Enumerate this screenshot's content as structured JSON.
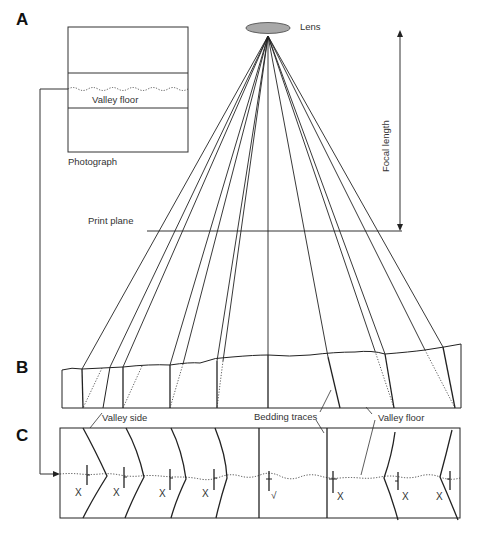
{
  "panels": {
    "a": "A",
    "b": "B",
    "c": "C"
  },
  "labels": {
    "lens": "Lens",
    "focal_length": "Focal length",
    "print_plane": "Print plane",
    "photograph": "Photograph",
    "photo_valley_floor": "Valley floor",
    "valley_side": "Valley side",
    "bedding_traces": "Bedding traces",
    "valley_floor": "Valley floor"
  },
  "marks": [
    "X",
    "X",
    "X",
    "X",
    "√",
    "X",
    "X",
    "X"
  ],
  "colors": {
    "line": "#222222",
    "lens_fill": "#a8a8a8",
    "text": "#333333"
  }
}
